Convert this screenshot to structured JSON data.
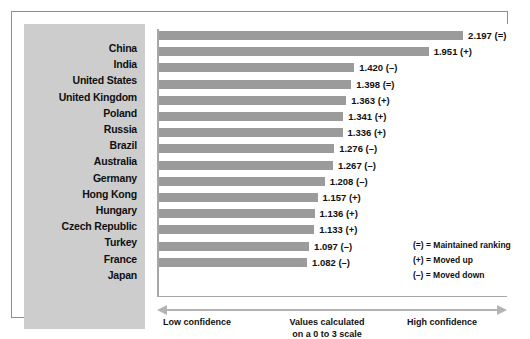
{
  "chart_data": {
    "type": "bar",
    "orientation": "horizontal",
    "title": "",
    "xlabel": "Values calculated on a 0 to 3 scale",
    "ylabel": "",
    "xlim": [
      0,
      3
    ],
    "grid": false,
    "categories": [
      "China",
      "India",
      "United States",
      "United Kingdom",
      "Poland",
      "Russia",
      "Brazil",
      "Australia",
      "Germany",
      "Hong Kong",
      "Hungary",
      "Czech Republic",
      "Turkey",
      "France",
      "Japan"
    ],
    "values": [
      2.197,
      1.951,
      1.42,
      1.398,
      1.363,
      1.341,
      1.336,
      1.276,
      1.267,
      1.208,
      1.157,
      1.136,
      1.133,
      1.097,
      1.082
    ],
    "value_labels": [
      "2.197 (=)",
      "1.951 (+)",
      "1.420 (–)",
      "1.398 (=)",
      "1.363 (+)",
      "1.341 (+)",
      "1.336 (+)",
      "1.276 (–)",
      "1.267 (–)",
      "1.208 (–)",
      "1.157 (+)",
      "1.136 (+)",
      "1.133 (+)",
      "1.097 (–)",
      "1.082 (–)"
    ],
    "rank_markers": [
      "=",
      "+",
      "–",
      "=",
      "+",
      "+",
      "+",
      "–",
      "–",
      "–",
      "+",
      "+",
      "+",
      "–",
      "–"
    ],
    "legend_position": "inside-bottom-right",
    "bar_color": "#9b9b9b",
    "panel_color": "#cdcdcd"
  },
  "legend": {
    "entries": [
      "(=) = Maintained ranking",
      "(+) = Moved up",
      "(–) = Moved down"
    ]
  },
  "axis": {
    "low_label": "Low confidence",
    "mid_label": "Values calculated on a 0 to 3 scale",
    "high_label": "High confidence"
  }
}
